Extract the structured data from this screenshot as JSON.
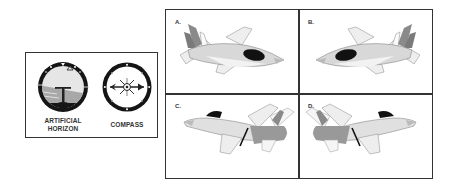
{
  "instruments": {
    "artificial_horizon": {
      "label_line1": "ARTIFICIAL",
      "label_line2": "HORIZON",
      "icon": "artificial-horizon-icon"
    },
    "compass": {
      "label": "COMPASS",
      "icon": "compass-icon"
    }
  },
  "options": [
    {
      "label": "A.",
      "description": "Jet viewed from upper-left rear, nose pointing right, banked"
    },
    {
      "label": "B.",
      "description": "Jet viewed from upper-right rear, nose pointing left, banked"
    },
    {
      "label": "C.",
      "description": "Jet side-on, nose pointing left, tail right"
    },
    {
      "label": "D.",
      "description": "Jet side-on, nose pointing right, tail left"
    }
  ],
  "colors": {
    "border": "#333333",
    "fuselage": "#d8d8d8",
    "wing": "#eeeeee",
    "tail": "#8a8a8a",
    "canopy": "#111111",
    "sky": "#e6e6e6",
    "ground": "#a8a8a8"
  }
}
